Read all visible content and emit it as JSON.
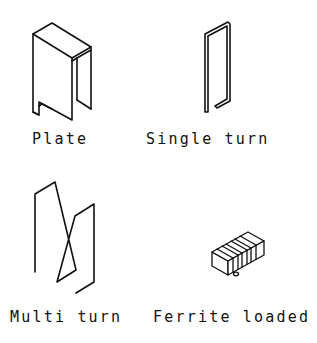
{
  "diagram": {
    "colors": {
      "stroke": "#111111",
      "background": "#ffffff"
    },
    "items": [
      {
        "id": "plate",
        "label": "Plate"
      },
      {
        "id": "single-turn",
        "label": "Single turn"
      },
      {
        "id": "multi-turn",
        "label": "Multi turn"
      },
      {
        "id": "ferrite-loaded",
        "label": "Ferrite loaded"
      }
    ]
  }
}
